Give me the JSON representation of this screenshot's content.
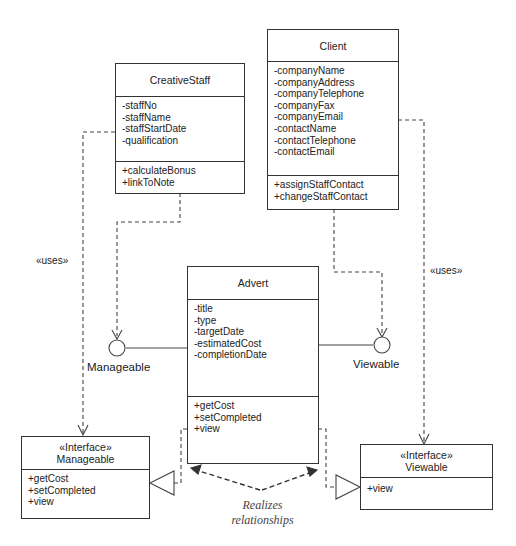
{
  "diagram": {
    "type": "UML class diagram",
    "classes": {
      "creative_staff": {
        "name": "CreativeStaff",
        "attributes": [
          "-staffNo",
          "-staffName",
          "-staffStartDate",
          "-qualification"
        ],
        "operations": [
          "+calculateBonus",
          "+linkToNote"
        ]
      },
      "client": {
        "name": "Client",
        "attributes": [
          "-companyName",
          "-companyAddress",
          "-companyTelephone",
          "-companyFax",
          "-companyEmail",
          "-contactName",
          "-contactTelephone",
          "-contactEmail"
        ],
        "operations": [
          "+assignStaffContact",
          "+changeStaffContact"
        ]
      },
      "advert": {
        "name": "Advert",
        "attributes": [
          "-title",
          "-type",
          "-targetDate",
          "-estimatedCost",
          "-completionDate"
        ],
        "operations": [
          "+getCost",
          "+setCompleted",
          "+view"
        ]
      }
    },
    "interfaces": {
      "manageable": {
        "stereotype": "«Interface»",
        "name": "Manageable",
        "operations": [
          "+getCost",
          "+setCompleted",
          "+view"
        ]
      },
      "viewable": {
        "stereotype": "«Interface»",
        "name": "Viewable",
        "operations": [
          "+view"
        ]
      }
    },
    "lollipops": {
      "manageable_label": "Manageable",
      "viewable_label": "Viewable"
    },
    "labels": {
      "uses_left": "«uses»",
      "uses_right": "«uses»",
      "realizes_line1": "Realizes",
      "realizes_line2": "relationships"
    },
    "relationships": [
      {
        "from": "CreativeStaff",
        "to": "Manageable (lollipop)",
        "kind": "dependency"
      },
      {
        "from": "CreativeStaff",
        "to": "Manageable (interface)",
        "kind": "uses"
      },
      {
        "from": "Client",
        "to": "Viewable (lollipop)",
        "kind": "dependency"
      },
      {
        "from": "Client",
        "to": "Viewable (interface)",
        "kind": "uses"
      },
      {
        "from": "Advert",
        "to": "Manageable",
        "kind": "realization"
      },
      {
        "from": "Advert",
        "to": "Viewable",
        "kind": "realization"
      }
    ]
  }
}
